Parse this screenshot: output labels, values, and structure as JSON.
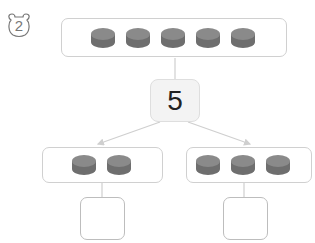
{
  "problem": {
    "number": "2",
    "icon": "bear-face-badge"
  },
  "total": {
    "coins": 5,
    "value": "5"
  },
  "parts": [
    {
      "side": "left",
      "coins": 2,
      "answer": ""
    },
    {
      "side": "right",
      "coins": 3,
      "answer": ""
    }
  ],
  "colors": {
    "coin_top": "#8a8a8a",
    "coin_side": "#6e6e6e",
    "border": "#d0d0d0",
    "line": "#cfcfcf"
  }
}
